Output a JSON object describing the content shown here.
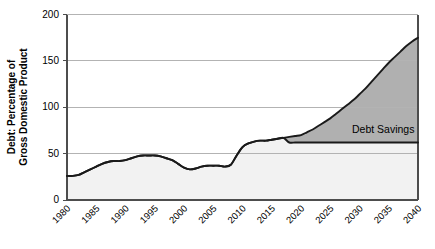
{
  "chart_data": {
    "type": "area",
    "title": "",
    "xlabel": "",
    "ylabel": "Debt: Percentage of Gross Domestic Product",
    "ylabel_line1": "Debt: Percentage of",
    "ylabel_line2": "Gross Domestic Product",
    "xlim": [
      1980,
      2040
    ],
    "ylim": [
      0,
      200
    ],
    "ytick_values": [
      0,
      50,
      100,
      150,
      200
    ],
    "ytick_labels": [
      "0",
      "50",
      "100",
      "150",
      "200"
    ],
    "xtick_values": [
      1980,
      1985,
      1990,
      1995,
      2000,
      2005,
      2010,
      2015,
      2020,
      2025,
      2030,
      2035,
      2040
    ],
    "xtick_labels": [
      "1980",
      "1985",
      "1990",
      "1995",
      "2000",
      "2005",
      "2010",
      "2015",
      "2020",
      "2025",
      "2030",
      "2035",
      "2040"
    ],
    "grid": "horizontal",
    "legend": "none",
    "annotations": [
      {
        "text": "Debt Savings",
        "x": 2029,
        "y": 85,
        "name": "debt-savings-label"
      }
    ],
    "colors": {
      "savings_fill": "#b0b0b0",
      "baseline_fill": "#f2f2f2",
      "line": "#1a1a1a",
      "gridline": "#b3b3b3",
      "axis": "#4d4d4d"
    },
    "series": [
      {
        "name": "Projected Debt",
        "type": "upper-boundary",
        "x": [
          1980,
          1981,
          1982,
          1983,
          1984,
          1985,
          1986,
          1987,
          1988,
          1989,
          1990,
          1991,
          1992,
          1993,
          1994,
          1995,
          1996,
          1997,
          1998,
          1999,
          2000,
          2001,
          2002,
          2003,
          2004,
          2005,
          2006,
          2007,
          2008,
          2009,
          2010,
          2011,
          2012,
          2013,
          2014,
          2015,
          2016,
          2017,
          2018,
          2019,
          2020,
          2021,
          2022,
          2023,
          2024,
          2025,
          2026,
          2027,
          2028,
          2029,
          2030,
          2031,
          2032,
          2033,
          2034,
          2035,
          2036,
          2037,
          2038,
          2039,
          2040
        ],
        "values": [
          26,
          26,
          27,
          30,
          33,
          36,
          39,
          41,
          42,
          42,
          43,
          45,
          47,
          48,
          48,
          48,
          47,
          45,
          43,
          39,
          35,
          33,
          34,
          36,
          37,
          37,
          37,
          36,
          38,
          48,
          57,
          61,
          63,
          64,
          64,
          65,
          66,
          67,
          68,
          69,
          70,
          73,
          76,
          80,
          84,
          88,
          93,
          98,
          103,
          108,
          114,
          120,
          127,
          134,
          141,
          148,
          154,
          160,
          166,
          171,
          175
        ]
      },
      {
        "name": "Debt With Savings",
        "type": "lower-boundary",
        "x": [
          1980,
          1981,
          1982,
          1983,
          1984,
          1985,
          1986,
          1987,
          1988,
          1989,
          1990,
          1991,
          1992,
          1993,
          1994,
          1995,
          1996,
          1997,
          1998,
          1999,
          2000,
          2001,
          2002,
          2003,
          2004,
          2005,
          2006,
          2007,
          2008,
          2009,
          2010,
          2011,
          2012,
          2013,
          2014,
          2015,
          2016,
          2017,
          2018,
          2019,
          2020,
          2021,
          2022,
          2023,
          2024,
          2025,
          2026,
          2027,
          2028,
          2029,
          2030,
          2031,
          2032,
          2033,
          2034,
          2035,
          2036,
          2037,
          2038,
          2039,
          2040
        ],
        "values": [
          26,
          26,
          27,
          30,
          33,
          36,
          39,
          41,
          42,
          42,
          43,
          45,
          47,
          48,
          48,
          48,
          47,
          45,
          43,
          39,
          35,
          33,
          34,
          36,
          37,
          37,
          37,
          36,
          38,
          48,
          57,
          61,
          63,
          64,
          64,
          65,
          66,
          67,
          62,
          62,
          62,
          62,
          62,
          62,
          62,
          62,
          62,
          62,
          62,
          62,
          62,
          62,
          62,
          62,
          62,
          62,
          62,
          62,
          62,
          62,
          62
        ]
      }
    ]
  }
}
